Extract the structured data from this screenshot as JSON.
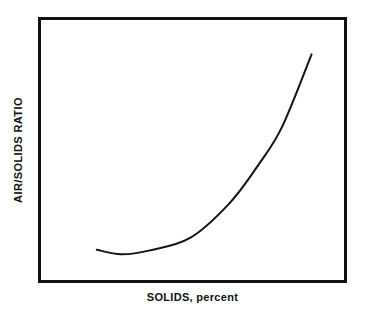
{
  "chart_data": {
    "type": "line",
    "title": "Effect of Air to Solids Ratio on Float Solids",
    "xlabel": "SOLIDS, percent",
    "ylabel": "AIR/SOLIDS RATIO",
    "grid": false,
    "legend": null,
    "axis_ticks": {
      "x": [],
      "y": []
    },
    "xlim": [
      0,
      100
    ],
    "ylim": [
      0,
      100
    ],
    "series": [
      {
        "name": "Air/solids ratio vs solids",
        "shape": "J-curve with shallow minimum then steep rise",
        "x": [
          18.4,
          26.5,
          35.6,
          49.2,
          62.1,
          71.8,
          79.6,
          89.3
        ],
        "y": [
          11.6,
          9.9,
          11.3,
          16.2,
          29.4,
          44.4,
          59.0,
          86.8
        ],
        "color": "#141414",
        "line_width": 2
      }
    ]
  },
  "frame": {
    "border_color": "#111111",
    "fill_color": "#ffffff"
  }
}
